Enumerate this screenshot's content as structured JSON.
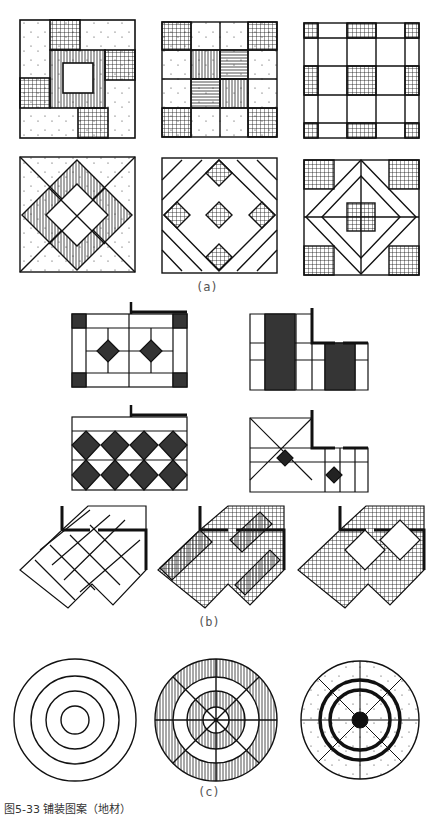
{
  "figure": {
    "caption": "图5-33  铺装图案（地材）",
    "panels": [
      {
        "id": "a",
        "label": "(a)",
        "description": "Six square paving patterns in two rows of three"
      },
      {
        "id": "b",
        "label": "(b)",
        "description": "Room-floor tile layouts with wall corners: rectangular and L-shaped plans, plus three diagonal tile layouts"
      },
      {
        "id": "c",
        "label": "(c)",
        "description": "Three circular paving patterns"
      }
    ]
  },
  "colors": {
    "ink": "#111111",
    "hatch": "#333333",
    "paper": "#ffffff",
    "caption": "#555555"
  }
}
